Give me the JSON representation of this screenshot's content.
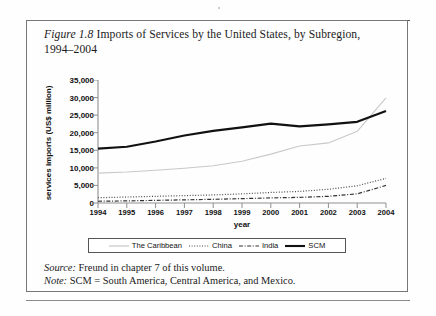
{
  "figure": {
    "number_label": "Figure 1.8",
    "title_text": " Imports of Services by the United States, by Subregion, 1994–2004",
    "source_label": "Source:",
    "source_text": " Freund in chapter 7 of this volume.",
    "note_label": "Note:",
    "note_text": " SCM = South America, Central America, and Mexico."
  },
  "colors": {
    "caribbean": "#c9c9c9",
    "china": "#4a4a4a",
    "india": "#333333",
    "scm": "#111111",
    "axis": "#888888",
    "text": "#111111"
  },
  "chart_data": {
    "type": "line",
    "title": "Imports of Services by the United States, by Subregion, 1994–2004",
    "xlabel": "year",
    "ylabel": "services imports (US$ million)",
    "categories": [
      "1994",
      "1995",
      "1996",
      "1997",
      "1998",
      "1999",
      "2000",
      "2001",
      "2002",
      "2003",
      "2004"
    ],
    "x": [
      1994,
      1995,
      1996,
      1997,
      1998,
      1999,
      2000,
      2001,
      2002,
      2003,
      2004
    ],
    "xlim": [
      1994,
      2004
    ],
    "ylim": [
      0,
      35000
    ],
    "ytick_labels": [
      "0",
      "5,000",
      "10,000",
      "15,000",
      "20,000",
      "25,000",
      "30,000",
      "35,000"
    ],
    "yticks": [
      0,
      5000,
      10000,
      15000,
      20000,
      25000,
      30000,
      35000
    ],
    "grid": false,
    "legend_position": "bottom",
    "series": [
      {
        "name": "The Caribbean",
        "style": "solid-thin",
        "color": "#c9c9c9",
        "values": [
          8500,
          8800,
          9300,
          9900,
          10600,
          11900,
          13900,
          16200,
          17100,
          20400,
          29900
        ]
      },
      {
        "name": "China",
        "style": "dotted",
        "color": "#4a4a4a",
        "values": [
          1500,
          1700,
          1900,
          2100,
          2300,
          2600,
          3000,
          3300,
          3900,
          4900,
          7000
        ]
      },
      {
        "name": "India",
        "style": "dash-dot",
        "color": "#333333",
        "values": [
          500,
          600,
          750,
          900,
          1050,
          1250,
          1450,
          1600,
          1900,
          2600,
          5000
        ]
      },
      {
        "name": "SCM",
        "style": "solid-thick",
        "color": "#111111",
        "values": [
          15500,
          16000,
          17500,
          19200,
          20500,
          21500,
          22600,
          21800,
          22400,
          23100,
          26200
        ]
      }
    ]
  },
  "legend": {
    "items": [
      {
        "label": "The Caribbean",
        "swatch": "line-solid-thin-gray"
      },
      {
        "label": "China",
        "swatch": "line-dotted"
      },
      {
        "label": "India",
        "swatch": "line-dash-dot"
      },
      {
        "label": "SCM",
        "swatch": "line-solid-thick-black"
      }
    ]
  }
}
